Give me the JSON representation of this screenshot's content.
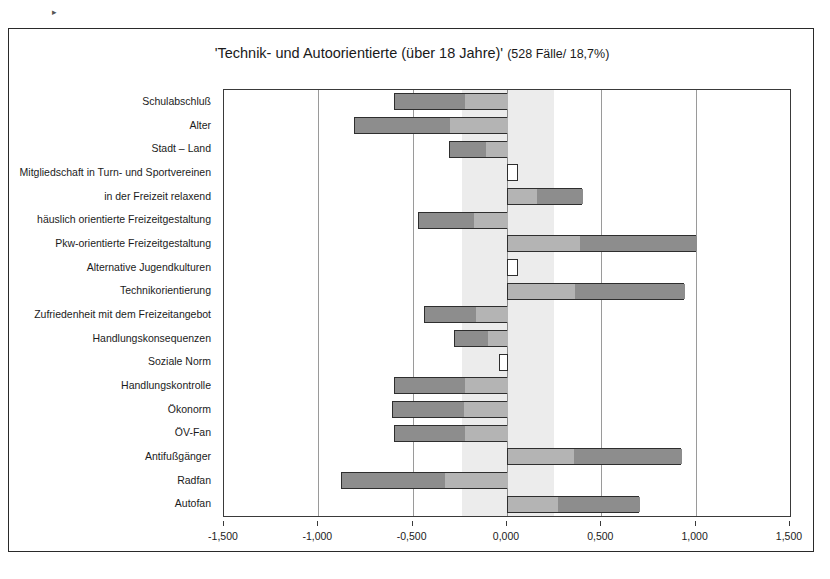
{
  "page": {
    "stray_mark": "▸"
  },
  "chart_data": {
    "type": "bar",
    "orientation": "horizontal",
    "title_main": "'Technik- und Autoorientierte (über 18 Jahre)'",
    "title_sub": "(528 Fälle/ 18,7%)",
    "title_full": "'Technik- und Autoorientierte (über 18 Jahre)' (528 Fälle/ 18,7%)",
    "n_cases": 528,
    "share_percent": "18,7%",
    "xlabel": "",
    "ylabel": "",
    "xlim": [
      -1.5,
      1.5
    ],
    "xtick_values": [
      -1.5,
      -1.0,
      -0.5,
      0.0,
      0.5,
      1.0,
      1.5
    ],
    "xtick_labels": [
      "-1,500",
      "-1,000",
      "-0,500",
      "0,000",
      "0,500",
      "1,000",
      "1,500"
    ],
    "grid": true,
    "legend": "none",
    "significance_band": {
      "label": "significance-band",
      "from": -0.24,
      "to": 0.25,
      "color": "#ececec"
    },
    "colors": {
      "bar_dark": "#8d8d8d",
      "bar_light": "#b4b4b4",
      "bar_blank": "#ffffff",
      "bar_border": "#2e2e2e",
      "frame": "#2a2a2a",
      "gridline": "#9a9a9a"
    },
    "categories": [
      "Schulabschluß",
      "Alter",
      "Stadt – Land",
      "Mitgliedschaft in Turn- und Sportvereinen",
      "in der Freizeit relaxend",
      "häuslich orientierte Freizeitgestaltung",
      "Pkw-orientierte Freizeitgestaltung",
      "Alternative Jugendkulturen",
      "Technikorientierung",
      "Zufriedenheit mit dem Freizeitangebot",
      "Handlungskonsequenzen",
      "Soziale Norm",
      "Handlungskontrolle",
      "Ökonorm",
      "ÖV-Fan",
      "Antifußgänger",
      "Radfan",
      "Autofan"
    ],
    "values": [
      -0.6,
      -0.81,
      -0.31,
      0.06,
      0.4,
      -0.47,
      1.0,
      0.06,
      0.94,
      -0.44,
      -0.28,
      -0.04,
      -0.6,
      -0.61,
      -0.6,
      0.92,
      -0.88,
      0.7
    ],
    "bar_styles": [
      "shaded",
      "shaded",
      "shaded",
      "blank",
      "shaded",
      "shaded",
      "shaded",
      "blank",
      "shaded",
      "shaded",
      "shaded",
      "blank",
      "shaded",
      "shaded",
      "shaded",
      "shaded",
      "shaded",
      "shaded"
    ]
  }
}
